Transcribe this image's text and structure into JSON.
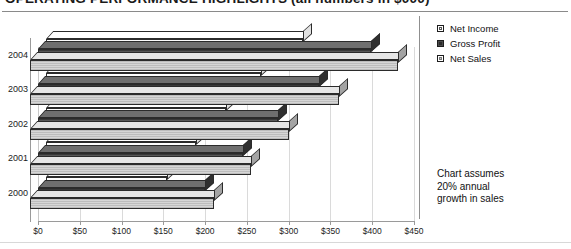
{
  "title": "OPERATING PERFORMANCE HIGHLIGHTS (all numbers in $000)",
  "annotation": {
    "line1": "Chart assumes",
    "line2": "20% annual",
    "line3": "growth in sales"
  },
  "legend": {
    "items": [
      {
        "label": "Net Income",
        "key": "net_income",
        "swatch": "light-square-icon"
      },
      {
        "label": "Gross Profit",
        "key": "gross_profit",
        "swatch": "dark-square-icon"
      },
      {
        "label": "Net Sales",
        "key": "net_sales",
        "swatch": "grey-square-icon"
      }
    ]
  },
  "chart_data": {
    "type": "bar",
    "orientation": "horizontal",
    "title": "OPERATING PERFORMANCE HIGHLIGHTS (all numbers in $000)",
    "xlabel": "",
    "ylabel": "",
    "categories": [
      "2000",
      "2001",
      "2002",
      "2003",
      "2004"
    ],
    "xlim": [
      0,
      450
    ],
    "xticks": [
      0,
      50,
      100,
      150,
      200,
      250,
      300,
      350,
      400,
      450
    ],
    "xticklabels": [
      "$0",
      "$50",
      "$100",
      "$150",
      "$200",
      "$250",
      "$300",
      "$350",
      "$400",
      "$450"
    ],
    "grid": true,
    "legend_position": "right-top",
    "style": "3d-bar",
    "units": "$000",
    "annotations": [
      "Chart assumes 20% annual growth in sales"
    ],
    "series": [
      {
        "name": "Net Income",
        "values": [
          145,
          180,
          215,
          257,
          308
        ]
      },
      {
        "name": "Gross Profit",
        "values": [
          200,
          245,
          287,
          336,
          398
        ]
      },
      {
        "name": "Net Sales",
        "values": [
          220,
          265,
          310,
          370,
          440
        ]
      }
    ]
  }
}
